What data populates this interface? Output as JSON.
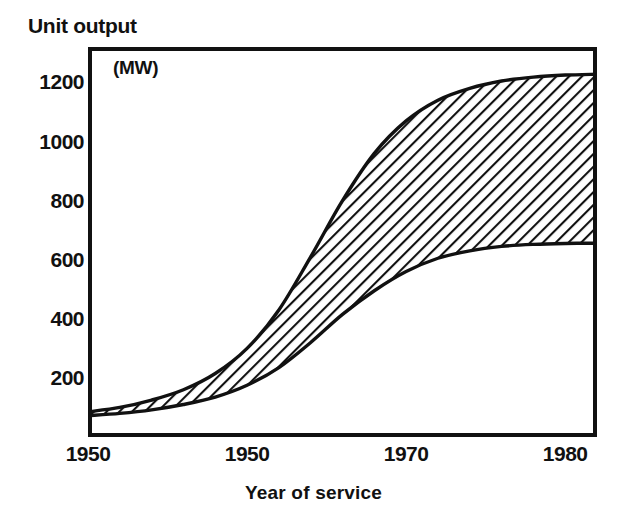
{
  "chart_data": {
    "type": "area",
    "title": "Unit output",
    "subtitle": "(MW)",
    "ylabel": "Unit output",
    "yunit": "(MW)",
    "xlabel": "Year of service",
    "grid": false,
    "legend": "none",
    "xlim": [
      1950,
      1982
    ],
    "ylim": [
      0,
      1320
    ],
    "xticks": [
      1950,
      1960,
      1970,
      1980
    ],
    "xticklabels": [
      "1950",
      "1950",
      "1970",
      "1980"
    ],
    "yticks": [
      200,
      400,
      600,
      800,
      1000,
      1200
    ],
    "yticklabels": [
      "200",
      "400",
      "600",
      "800",
      "1000",
      "1200"
    ],
    "series": [
      {
        "name": "Upper bound of unit output range",
        "x": [
          1950,
          1952,
          1954,
          1956,
          1958,
          1960,
          1962,
          1964,
          1966,
          1968,
          1970,
          1972,
          1974,
          1976,
          1978,
          1980,
          1982
        ],
        "values": [
          85,
          100,
          125,
          160,
          215,
          300,
          430,
          610,
          800,
          960,
          1070,
          1140,
          1180,
          1205,
          1218,
          1225,
          1228
        ]
      },
      {
        "name": "Lower bound of unit output range",
        "x": [
          1950,
          1952,
          1954,
          1956,
          1958,
          1960,
          1962,
          1964,
          1966,
          1968,
          1970,
          1972,
          1974,
          1976,
          1978,
          1980,
          1982
        ],
        "values": [
          72,
          80,
          92,
          110,
          135,
          175,
          235,
          320,
          415,
          495,
          560,
          605,
          630,
          645,
          652,
          655,
          656
        ]
      }
    ],
    "fill": {
      "between": [
        "Upper bound of unit output range",
        "Lower bound of unit output range"
      ],
      "pattern": "diagonal-hatch",
      "pattern_angle_deg": 45,
      "color": "#111111"
    }
  },
  "colors": {
    "ink": "#111111",
    "background": "#ffffff",
    "hatch": "#111111"
  }
}
